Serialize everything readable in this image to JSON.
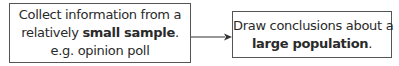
{
  "diagram": {
    "left_box": {
      "line1": "Collect information from a",
      "line2_prefix": "relatively ",
      "line2_bold": "small sample",
      "line2_suffix": ".",
      "line3": "e.g. opinion poll"
    },
    "arrow": {
      "icon": "arrow-right-icon",
      "color": "#333333"
    },
    "right_box": {
      "line1": "Draw conclusions about a",
      "line2_bold": "large population",
      "line2_suffix": "."
    }
  }
}
